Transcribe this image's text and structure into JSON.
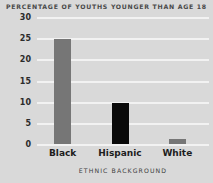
{
  "chart_data": {
    "type": "bar",
    "title": "PERCENTAGE OF YOUTHS YOUNGER THAN AGE 18",
    "xlabel": "ETHNIC BACKGROUND",
    "ylabel": "",
    "categories": [
      "Black",
      "Hispanic",
      "White"
    ],
    "values": [
      25,
      10,
      1.5
    ],
    "bar_colors": [
      "#767676",
      "#0a0a0a",
      "#767676"
    ],
    "ylim": [
      0,
      30
    ],
    "yticks": [
      0,
      5,
      10,
      15,
      20,
      25,
      30
    ],
    "ytick_labels": [
      "0",
      "5",
      "10",
      "15",
      "20",
      "25",
      "30"
    ],
    "grid": true,
    "gridline_color": "#f2f2f2",
    "legend": false,
    "background_color": "#d9d9d9",
    "title_color": "#4a4a4a",
    "tick_label_color": "#2b2b2b",
    "category_label_color": "#1d1d1d"
  }
}
